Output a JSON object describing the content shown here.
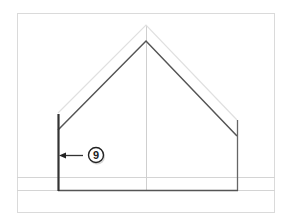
{
  "diagram": {
    "type": "elevation-drawing",
    "callout": {
      "number": "9"
    },
    "colors": {
      "frame": "#d8d8d8",
      "guide": "#cfcfcf",
      "ghost": "#dcdcdc",
      "outline": "#555555",
      "wall": "#333333"
    }
  }
}
